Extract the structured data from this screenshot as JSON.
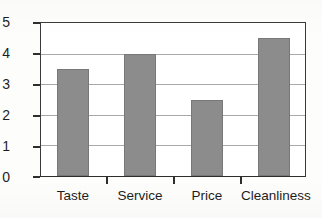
{
  "chart_data": {
    "type": "bar",
    "title": "",
    "subtitle": "",
    "xlabel": "",
    "ylabel": "",
    "categories": [
      "Taste",
      "Service",
      "Price",
      "Cleanliness"
    ],
    "values": [
      3.5,
      4,
      2.5,
      4.5
    ],
    "ylim": [
      0,
      5
    ],
    "ytick_labels": [
      "0",
      "1",
      "2",
      "3",
      "4",
      "5"
    ],
    "ytick_values": [
      0,
      1,
      2,
      3,
      4,
      5
    ],
    "grid": true,
    "grid_axis": "y",
    "legend": false,
    "legend_position": "none",
    "annotations": [],
    "bar_color": "#8c8c8c",
    "bar_edge_color": "#787878",
    "axis_color": "#2e2e2e",
    "gridline_color": "#a9a9a9",
    "background_color": "#ffffff"
  }
}
